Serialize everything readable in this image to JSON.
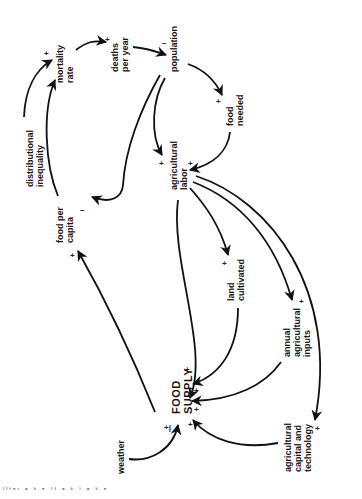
{
  "diagram": {
    "orientation": "rotated 90 degrees counter-clockwise",
    "nodes": [
      {
        "id": "mortality_rate",
        "lines": [
          "mortality",
          "rate"
        ]
      },
      {
        "id": "deaths_per_year",
        "lines": [
          "deaths",
          "per year"
        ]
      },
      {
        "id": "population",
        "lines": [
          "population"
        ]
      },
      {
        "id": "food_needed",
        "lines": [
          "food",
          "needed"
        ]
      },
      {
        "id": "distributional_inequality",
        "lines": [
          "distributional",
          "inequality"
        ]
      },
      {
        "id": "agricultural_labor",
        "lines": [
          "agricultural",
          "labor"
        ]
      },
      {
        "id": "food_per_capita",
        "lines": [
          "food per",
          "capita"
        ]
      },
      {
        "id": "land_cultivated",
        "lines": [
          "land",
          "cultivated"
        ]
      },
      {
        "id": "annual_agricultural_inputs",
        "lines": [
          "annual",
          "agricultural",
          "inputs"
        ]
      },
      {
        "id": "food_supply",
        "lines": [
          "FOOD",
          "SUPPLY"
        ]
      },
      {
        "id": "weather",
        "lines": [
          "weather"
        ]
      },
      {
        "id": "agricultural_capital_and_technology",
        "lines": [
          "agricultural",
          "capital and",
          "technology"
        ]
      }
    ],
    "links": [
      {
        "from": "mortality_rate",
        "to": "deaths_per_year",
        "polarity": "+"
      },
      {
        "from": "deaths_per_year",
        "to": "population",
        "polarity": "−"
      },
      {
        "from": "population",
        "to": "food_needed",
        "polarity": "+"
      },
      {
        "from": "population",
        "to": "agricultural_labor",
        "polarity": "+"
      },
      {
        "from": "population",
        "to": "food_per_capita",
        "polarity": "−"
      },
      {
        "from": "food_needed",
        "to": "agricultural_labor",
        "polarity": "+"
      },
      {
        "from": "distributional_inequality",
        "to": "mortality_rate",
        "polarity": "+"
      },
      {
        "from": "food_per_capita",
        "to": "mortality_rate",
        "polarity": "−"
      },
      {
        "from": "agricultural_labor",
        "to": "land_cultivated",
        "polarity": "+"
      },
      {
        "from": "agricultural_labor",
        "to": "annual_agricultural_inputs",
        "polarity": "+"
      },
      {
        "from": "agricultural_labor",
        "to": "agricultural_capital_and_technology",
        "polarity": "+"
      },
      {
        "from": "agricultural_labor",
        "to": "food_supply",
        "polarity": "+"
      },
      {
        "from": "land_cultivated",
        "to": "food_supply",
        "polarity": "+"
      },
      {
        "from": "annual_agricultural_inputs",
        "to": "food_supply",
        "polarity": "+"
      },
      {
        "from": "agricultural_capital_and_technology",
        "to": "food_supply",
        "polarity": "+"
      },
      {
        "from": "weather",
        "to": "food_supply",
        "polarity": "+/−"
      },
      {
        "from": "food_supply",
        "to": "food_per_capita",
        "polarity": "+"
      }
    ],
    "signs": {
      "mortality_in_plus": "+",
      "mortality_in_minus": "−",
      "deaths_in": "+",
      "population_in": "−",
      "food_needed_in": "+",
      "labor_in_pop": "+",
      "labor_in_food": "+",
      "fpc_in_minus": "−",
      "fpc_in_plus": "+",
      "land_in": "+",
      "inputs_in": "+",
      "tech_in": "+",
      "fs_in_labor": "+",
      "fs_in_land": "+",
      "fs_in_inputs": "+",
      "fs_in_tech": "+",
      "fs_in_weather": "+|"
    },
    "caption": "ᴵᴵᵗᵉʳ ᵃ ᵏ ᵉ ⁽ᶠ ᵃ ᵏ ⁾ ᵃ ᵏ ᵉ"
  }
}
